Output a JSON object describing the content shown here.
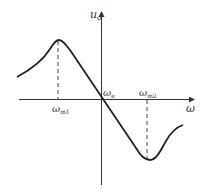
{
  "diagram": {
    "type": "frequency-discriminator characteristic curve",
    "axes": {
      "y": {
        "label": "u",
        "label_sub": "o"
      },
      "x": {
        "label": "ω"
      }
    },
    "points": {
      "origin": {
        "label": "ω",
        "label_sub": "e"
      },
      "peak": {
        "label": "ω",
        "label_sub": "m1"
      },
      "trough": {
        "label": "ω",
        "label_sub": "m2"
      }
    },
    "colors": {
      "stroke": "#222222",
      "axis": "#333333",
      "dash": "#444444"
    }
  }
}
